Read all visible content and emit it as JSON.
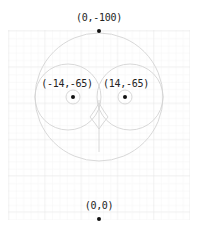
{
  "diagram": {
    "points": [
      {
        "id": "top",
        "label": "(0,-100)",
        "x": 0,
        "y": -100
      },
      {
        "id": "left-eye",
        "label": "(-14,-65)",
        "x": -14,
        "y": -65
      },
      {
        "id": "right-eye",
        "label": "(14,-65)",
        "x": 14,
        "y": -65
      },
      {
        "id": "origin",
        "label": "(0,0)",
        "x": 0,
        "y": 0
      }
    ],
    "colors": {
      "grid_minor": "#f0f0f0",
      "grid_major": "#e2e2e2",
      "construction": "#d0d0d0",
      "point": "#111111",
      "label": "#222222"
    }
  }
}
